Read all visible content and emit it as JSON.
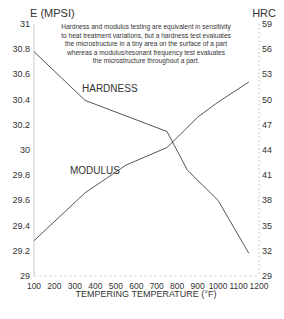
{
  "chart_data": {
    "type": "line",
    "title": "",
    "xlabel": "TEMPERING TEMPERATURE (°F)",
    "ylabel_left": "E (MPSI)",
    "ylabel_right": "HRC",
    "x": [
      100,
      300,
      700,
      800,
      1000,
      1150
    ],
    "xlim": [
      100,
      1200
    ],
    "ylim_left": [
      29,
      31
    ],
    "ylim_right": [
      29,
      59
    ],
    "x_ticks": [
      "100",
      "200",
      "300",
      "400",
      "500",
      "600",
      "700",
      "800",
      "900",
      "1000",
      "1100",
      "1200"
    ],
    "y_ticks_left": [
      "29",
      "29.2",
      "29.4",
      "29.6",
      "29.8",
      "30",
      "30.2",
      "30.4",
      "30.6",
      "30.8",
      "31"
    ],
    "y_ticks_right": [
      "29",
      "32",
      "35",
      "38",
      "41",
      "44",
      "47",
      "50",
      "53",
      "56",
      "59"
    ],
    "grid": false,
    "series": [
      {
        "name": "HARDNESS",
        "axis": "right",
        "points": [
          [
            100,
            55.7
          ],
          [
            350,
            49.9
          ],
          [
            750,
            46.2
          ],
          [
            850,
            41.6
          ],
          [
            1000,
            38.0
          ],
          [
            1150,
            31.7
          ]
        ]
      },
      {
        "name": "MODULUS",
        "axis": "left",
        "points": [
          [
            100,
            29.28
          ],
          [
            350,
            29.66
          ],
          [
            550,
            29.88
          ],
          [
            750,
            30.02
          ],
          [
            900,
            30.26
          ],
          [
            1000,
            30.38
          ],
          [
            1150,
            30.54
          ]
        ]
      }
    ],
    "annotations": [
      {
        "text": "HARDNESS"
      },
      {
        "text": "MODULUS"
      }
    ],
    "note_lines": [
      "Hardness and modulus testing are equivalent in sensitivity",
      "to heat treatment variations, but a hardness test evaluates",
      "the microstructure in a tiny area on the surface of a part",
      "whereas a modulus/resonant frequency test evaluates",
      "the microstructure throughout a part."
    ]
  }
}
